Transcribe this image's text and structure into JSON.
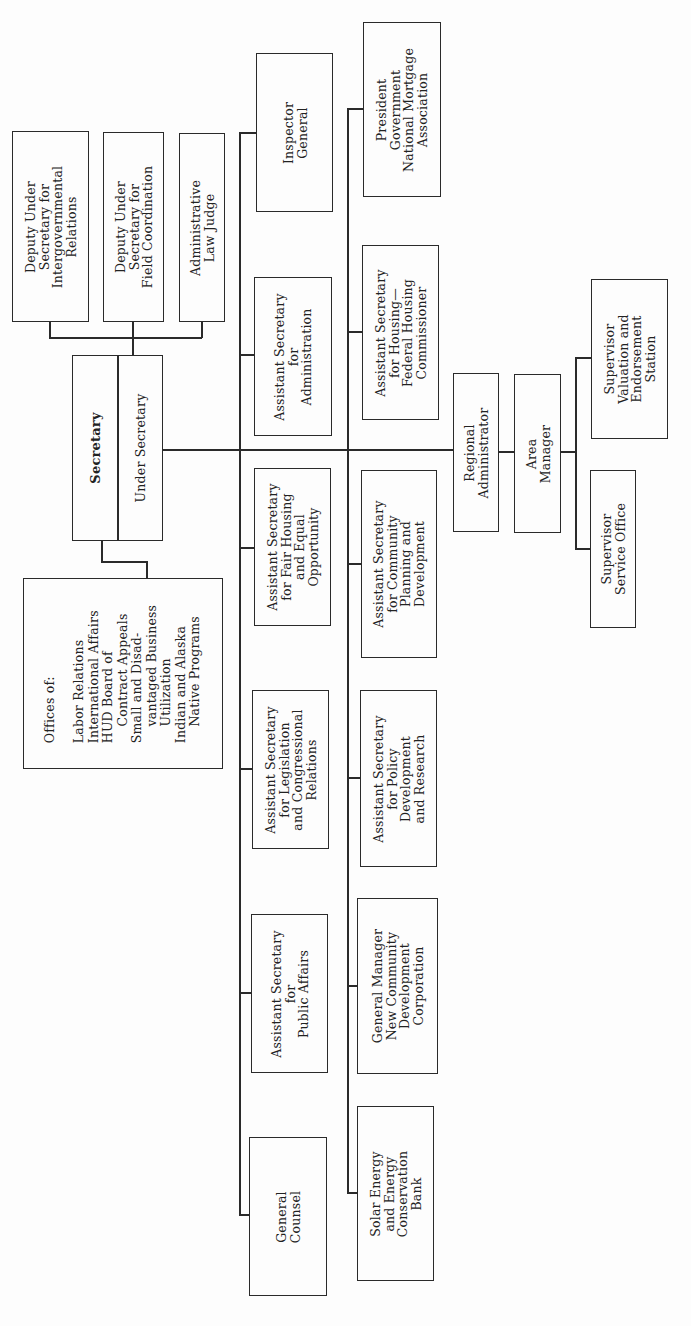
{
  "chart": {
    "orientation": "rotated 90 degrees counter-clockwise",
    "root": {
      "secretary": "Secretary",
      "under_secretary": "Under Secretary"
    },
    "staff": {
      "deputy_intergov": "Deputy Under\nSecretary for\nIntergovernmental\nRelations",
      "deputy_field": "Deputy Under\nSecretary for\nField Coordination",
      "admin_law_judge": "Administrative\nLaw Judge",
      "offices_of": "Offices of:\n\nLabor Relations\nInternational Affairs\nHUD Board of\n    Contract Appeals\nSmall and Disad-\n    vantaged Business\n    Utilization\nIndian and Alaska\n    Native Programs"
    },
    "upper_row": {
      "inspector_general": "Inspector\nGeneral",
      "asst_admin": "Assistant Secretary\nfor\nAdministration",
      "asst_fair_housing": "Assistant Secretary\nfor Fair Housing\nand Equal\nOpportunity",
      "asst_legislation": "Assistant Secretary\nfor Legislation\nand Congressional\nRelations",
      "asst_public_affairs": "Assistant Secretary\nfor\nPublic Affairs",
      "general_counsel": "General\nCounsel"
    },
    "lower_row": {
      "president_gnma": "President\nGovernment\nNational Mortgage\nAssociation",
      "asst_housing": "Assistant Secretary\nfor Housing—\nFederal Housing\nCommissioner",
      "asst_cpd": "Assistant Secretary\nfor Community\nPlanning and\nDevelopment",
      "asst_policy": "Assistant Secretary\nfor Policy\nDevelopment\nand Research",
      "gm_ncdc": "General Manager\nNew Community\nDevelopment\nCorporation",
      "solar_bank": "Solar Energy\nand Energy\nConservation\nBank"
    },
    "field": {
      "regional_admin": "Regional\nAdministrator",
      "area_manager": "Area\nManager",
      "supervisor_ve": "Supervisor\nValuation and\nEndorsement\nStation",
      "supervisor_so": "Supervisor\nService Office"
    }
  }
}
